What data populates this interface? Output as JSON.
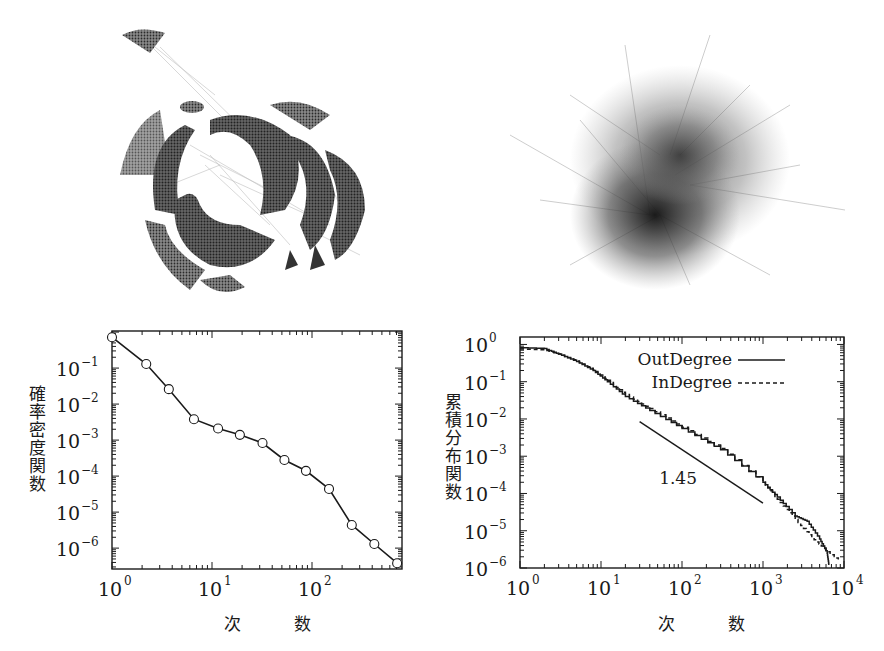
{
  "figure": {
    "panels": [
      {
        "id": "network-left",
        "type": "image",
        "description": "Network graph visualization with dense hemispherical clusters"
      },
      {
        "id": "network-right",
        "type": "image",
        "description": "Scale-free network graph visualization, hairball layout"
      }
    ]
  },
  "left_chart": {
    "ylabel": "確率密度関数",
    "xlabel": "次　数",
    "xticks": [
      "10",
      "10",
      "10"
    ],
    "xtick_exps": [
      "0",
      "1",
      "2"
    ],
    "yticks": [
      "10",
      "10",
      "10",
      "10",
      "10",
      "10"
    ],
    "ytick_exps": [
      "−1",
      "−2",
      "−3",
      "−4",
      "−5",
      "−6"
    ]
  },
  "right_chart": {
    "ylabel": "累積分布関数",
    "xlabel": "次　数",
    "xticks": [
      "10",
      "10",
      "10",
      "10",
      "10"
    ],
    "xtick_exps": [
      "0",
      "1",
      "2",
      "3",
      "4"
    ],
    "yticks": [
      "10",
      "10",
      "10",
      "10",
      "10",
      "10",
      "10"
    ],
    "ytick_exps": [
      "0",
      "−1",
      "−2",
      "−3",
      "−4",
      "−5",
      "−6"
    ],
    "legend": {
      "out": "OutDegree",
      "in": "InDegree"
    },
    "slope_annotation": "1.45"
  },
  "chart_data": [
    {
      "type": "line",
      "title": "",
      "xlabel": "次数",
      "ylabel": "確率密度関数",
      "xscale": "log",
      "yscale": "log",
      "xlim": [
        1,
        800
      ],
      "ylim": [
        2.6e-07,
        1.1
      ],
      "grid": false,
      "markers": "open-circle",
      "x": [
        1,
        2.2,
        3.7,
        6.6,
        11.5,
        19,
        32,
        53,
        87,
        148,
        250,
        420,
        710
      ],
      "y": [
        0.72,
        0.13,
        0.026,
        0.0038,
        0.0021,
        0.0014,
        0.00083,
        0.00028,
        0.00014,
        4.4e-05,
        4.4e-06,
        1.3e-06,
        3.8e-07
      ]
    },
    {
      "type": "line",
      "title": "",
      "xlabel": "次数",
      "ylabel": "累積分布関数",
      "xscale": "log",
      "yscale": "log",
      "xlim": [
        1,
        10000
      ],
      "ylim": [
        1e-06,
        1.6
      ],
      "grid": false,
      "legend_position": "upper right",
      "series": [
        {
          "name": "OutDegree",
          "style": "solid",
          "x": [
            1,
            2,
            3,
            5,
            8,
            12,
            20,
            40,
            100,
            300,
            1000,
            1500,
            2500,
            3500,
            5000,
            6200,
            6500
          ],
          "y": [
            0.82,
            0.78,
            0.55,
            0.35,
            0.2,
            0.1,
            0.04,
            0.017,
            0.0055,
            0.0015,
            0.0002,
            8e-05,
            2.5e-05,
            1.8e-05,
            6e-06,
            2.5e-06,
            1.2e-06
          ]
        },
        {
          "name": "InDegree",
          "style": "dashed",
          "x": [
            1,
            2,
            3,
            5,
            8,
            12,
            20,
            40,
            100,
            300,
            1000,
            1500,
            2500,
            4000,
            6000,
            8500
          ],
          "y": [
            0.75,
            0.72,
            0.55,
            0.36,
            0.21,
            0.11,
            0.045,
            0.019,
            0.006,
            0.0016,
            0.0002,
            7e-05,
            2e-05,
            6.5e-06,
            3e-06,
            1.7e-06
          ]
        },
        {
          "name": "slope 1.45",
          "style": "reference-line",
          "x": [
            30,
            1000
          ],
          "y": [
            0.0085,
            5.5e-05
          ]
        }
      ],
      "annotations": [
        {
          "text": "1.45",
          "x": 80,
          "y": 0.00025
        }
      ]
    }
  ]
}
